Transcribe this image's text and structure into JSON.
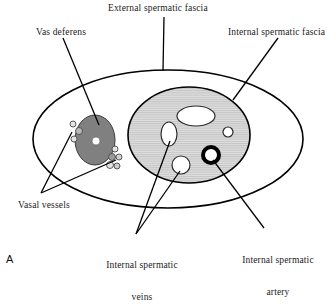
{
  "figure": {
    "panel_label": "A",
    "labels": {
      "external_spermatic_fascia": "External spermatic fascia",
      "vas_deferens": "Vas deferens",
      "internal_spermatic_fascia": "Internal spermatic fascia",
      "vasal_vessels": "Vasal vessels",
      "internal_spermatic_veins_line1": "Internal spermatic",
      "internal_spermatic_veins_line2": "veins",
      "internal_spermatic_artery_line1": "Internal spermatic",
      "internal_spermatic_artery_line2": "artery"
    },
    "colors": {
      "outline": "#000000",
      "inner_fascia_fill": "#d9d9d9",
      "inner_fascia_hatch": "#c2c2c2",
      "vas_deferens_fill": "#808080",
      "lumen_fill": "#ffffff",
      "artery_ring": "#000000",
      "text": "#1b1b1b",
      "background": "#ffffff"
    },
    "structures": {
      "external_spermatic_fascia": {
        "shape": "ellipse",
        "cx": 168,
        "cy": 139,
        "rx": 135,
        "ry": 69
      },
      "internal_spermatic_fascia": {
        "shape": "ellipse",
        "cx": 189,
        "cy": 135,
        "rx": 61,
        "ry": 48
      },
      "vas_deferens": {
        "shape": "ellipse",
        "cx": 95,
        "cy": 140,
        "rx": 20,
        "ry": 25,
        "lumen": {
          "cx": 96,
          "cy": 141,
          "r": 4
        }
      },
      "vasal_vessels": [
        {
          "cx": 73,
          "cy": 124,
          "r": 3
        },
        {
          "cx": 79,
          "cy": 131,
          "r": 3.5
        },
        {
          "cx": 74,
          "cy": 139,
          "r": 3
        },
        {
          "cx": 115,
          "cy": 149,
          "r": 3
        },
        {
          "cx": 112,
          "cy": 157,
          "r": 3.5
        },
        {
          "cx": 119,
          "cy": 157,
          "r": 3
        },
        {
          "cx": 110,
          "cy": 165,
          "r": 3.5
        },
        {
          "cx": 117,
          "cy": 166,
          "r": 3
        }
      ],
      "internal_spermatic_veins": [
        {
          "shape": "ellipse",
          "cx": 196,
          "cy": 116,
          "rx": 19,
          "ry": 10
        },
        {
          "shape": "ellipse",
          "cx": 169,
          "cy": 134,
          "rx": 8,
          "ry": 12
        },
        {
          "shape": "circle",
          "cx": 228,
          "cy": 132,
          "r": 5
        },
        {
          "shape": "circle",
          "cx": 181,
          "cy": 165,
          "r": 9
        }
      ],
      "internal_spermatic_artery": {
        "shape": "ring",
        "cx": 211,
        "cy": 155,
        "r": 8,
        "stroke_width": 4
      }
    },
    "leader_lines": [
      {
        "name": "external-spermatic-fascia-leader",
        "x1": 164,
        "y1": 17,
        "x2": 163,
        "y2": 71
      },
      {
        "name": "vas-deferens-leader",
        "x1": 63,
        "y1": 38,
        "x2": 99,
        "y2": 125
      },
      {
        "name": "internal-spermatic-fascia-leader",
        "x1": 278,
        "y1": 38,
        "x2": 233,
        "y2": 100
      },
      {
        "name": "vasal-vessels-leader-upper",
        "x1": 41,
        "y1": 193,
        "x2": 72,
        "y2": 132
      },
      {
        "name": "vasal-vessels-leader-lower",
        "x1": 41,
        "y1": 193,
        "x2": 116,
        "y2": 160
      },
      {
        "name": "internal-spermatic-veins-leader-left",
        "x1": 136,
        "y1": 234,
        "x2": 170,
        "y2": 141
      },
      {
        "name": "internal-spermatic-veins-leader-right",
        "x1": 136,
        "y1": 234,
        "x2": 180,
        "y2": 171
      },
      {
        "name": "internal-spermatic-artery-leader",
        "x1": 264,
        "y1": 228,
        "x2": 213,
        "y2": 160
      }
    ]
  }
}
